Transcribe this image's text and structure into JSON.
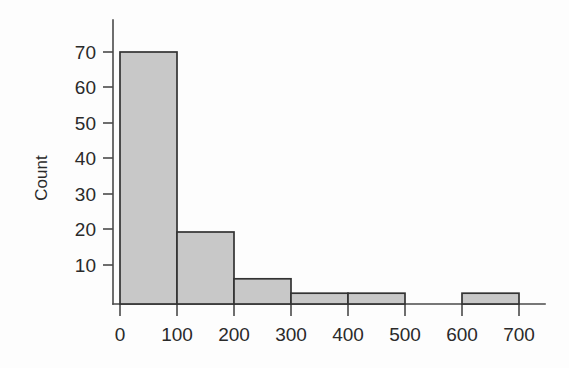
{
  "chart_data": {
    "type": "bar",
    "title": "",
    "xlabel": "",
    "ylabel": "Count",
    "bin_width": 100,
    "bin_edges": [
      0,
      100,
      200,
      300,
      400,
      500,
      600,
      700
    ],
    "categories": [
      "0-100",
      "100-200",
      "200-300",
      "300-400",
      "400-500",
      "500-600",
      "600-700"
    ],
    "values": [
      70,
      20,
      7,
      3,
      3,
      0,
      3
    ],
    "x_ticks": [
      0,
      100,
      200,
      300,
      400,
      500,
      600,
      700
    ],
    "x_tick_labels": [
      "0",
      "100",
      "200",
      "300",
      "400",
      "500",
      "600",
      "700"
    ],
    "y_ticks": [
      10,
      20,
      30,
      40,
      50,
      60,
      70
    ],
    "y_tick_labels": [
      "10",
      "20",
      "30",
      "40",
      "50",
      "60",
      "70"
    ],
    "xlim": [
      0,
      700
    ],
    "ylim": [
      0,
      75
    ],
    "grid": false,
    "legend": null,
    "bar_fill_color": "#c8c8c8",
    "bar_border_color": "#333333",
    "axis_color": "#4a4a4a",
    "background_color": "#fdfdfd"
  },
  "axes": {
    "y_title": "Count"
  }
}
